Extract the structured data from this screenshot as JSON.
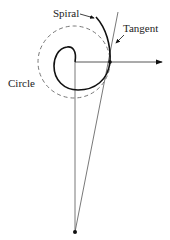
{
  "diagram": {
    "labels": {
      "spiral": "Spiral",
      "tangent": "Tangent",
      "circle": "Circle"
    },
    "colors": {
      "stroke": "#111111",
      "thin_line": "#555555",
      "dashed_circle": "#777777",
      "background": "#ffffff"
    },
    "geometry": {
      "center": [
        75,
        62
      ],
      "circle_radius": 36,
      "tangent_point": [
        110,
        62
      ],
      "bottom_point": [
        75,
        232
      ],
      "arrow_end": [
        162,
        62
      ],
      "spiral_outer_end": [
        96,
        17
      ]
    }
  }
}
